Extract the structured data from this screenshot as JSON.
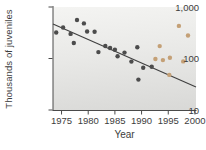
{
  "chart_data": {
    "type": "scatter",
    "title": "",
    "xlabel": "Year",
    "ylabel": "Thousands of juveniles",
    "xscale": "linear",
    "yscale": "log",
    "xlim": [
      1973.4,
      2000.2
    ],
    "ylim": [
      10,
      1000
    ],
    "x_ticks": [
      1975,
      1980,
      1985,
      1990,
      1995,
      2000
    ],
    "y_ticks": [
      1000,
      100,
      10
    ],
    "y_tick_labels": [
      "1,000",
      "100",
      "10"
    ],
    "grid": false,
    "legend": null,
    "series": [
      {
        "name": "dark",
        "label": "juveniles-observed",
        "marker": "circle",
        "color": "#4c4c4c",
        "points": [
          [
            1974.0,
            320
          ],
          [
            1975.3,
            400
          ],
          [
            1976.7,
            300
          ],
          [
            1977.3,
            200
          ],
          [
            1977.9,
            560
          ],
          [
            1979.2,
            480
          ],
          [
            1979.8,
            335
          ],
          [
            1981.2,
            330
          ],
          [
            1981.9,
            133
          ],
          [
            1983.2,
            175
          ],
          [
            1984.1,
            160
          ],
          [
            1985.0,
            148
          ],
          [
            1985.5,
            111
          ],
          [
            1986.8,
            130
          ],
          [
            1988.1,
            87
          ],
          [
            1989.2,
            165
          ],
          [
            1989.4,
            39
          ],
          [
            1990.3,
            66
          ],
          [
            1991.9,
            69
          ]
        ]
      },
      {
        "name": "light",
        "label": "juveniles-recent",
        "marker": "circle",
        "color": "#c4a076",
        "points": [
          [
            1992.6,
            98
          ],
          [
            1993.4,
            174
          ],
          [
            1994.0,
            93
          ],
          [
            1995.2,
            48
          ],
          [
            1995.3,
            103
          ],
          [
            1997.0,
            430
          ],
          [
            1997.8,
            88
          ],
          [
            1998.7,
            280
          ]
        ]
      }
    ],
    "trend_line": {
      "x": [
        1973.4,
        2000.2
      ],
      "y": [
        470,
        28
      ],
      "color": "#3f3f3f"
    }
  },
  "style": {
    "axis_color": "#4a4a4a",
    "tick_color": "#4a4a4a",
    "text_color": "#3d3d3d",
    "page_bg": "#ffffff"
  }
}
